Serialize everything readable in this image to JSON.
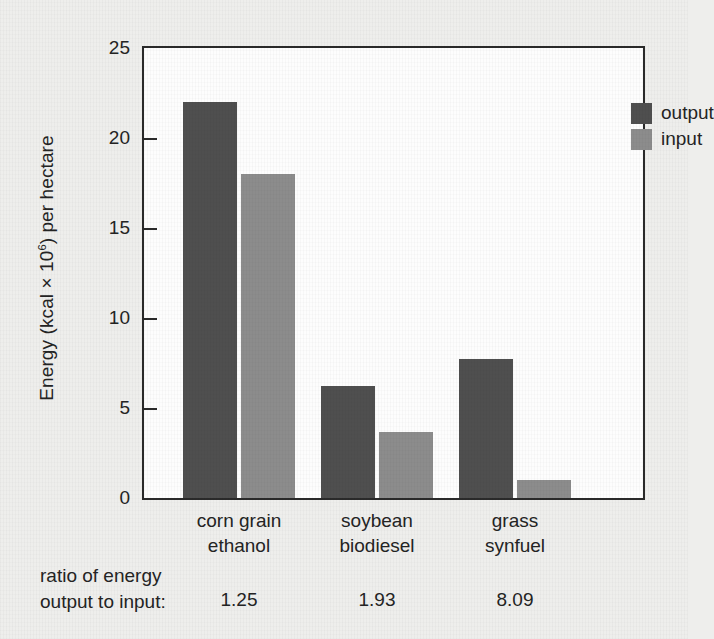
{
  "chart_data": {
    "type": "bar",
    "title": "",
    "subtitle": "",
    "xlabel": "",
    "ylabel": "Energy (kcal × 10⁶) per hectare",
    "ylabel_parts": {
      "before": "Energy (kcal × 10",
      "exponent": "6",
      "after": ") per hectare"
    },
    "categories": [
      "corn grain ethanol",
      "soybean biodiesel",
      "grass synfuel"
    ],
    "category_lines": [
      [
        "corn grain",
        "ethanol"
      ],
      [
        "soybean",
        "biodiesel"
      ],
      [
        "grass",
        "synfuel"
      ]
    ],
    "series": [
      {
        "name": "output",
        "values": [
          22.0,
          6.2,
          7.7
        ],
        "color": "#4f4f4f"
      },
      {
        "name": "input",
        "values": [
          18.0,
          3.65,
          1.0
        ],
        "color": "#8c8c8c"
      }
    ],
    "ylim": [
      0,
      25
    ],
    "yticks": [
      0,
      5,
      10,
      15,
      20,
      25
    ],
    "ytick_labels": [
      "0",
      "5",
      "10",
      "15",
      "20",
      "25"
    ],
    "grid": false,
    "legend_position": "top-right",
    "legend_entries": [
      "output",
      "input"
    ],
    "annotations": {
      "ratio_label_line1": "ratio of energy",
      "ratio_label_line2": "output to input:",
      "ratio_values": [
        "1.25",
        "1.93",
        "8.09"
      ]
    },
    "colors": {
      "output": "#4f4f4f",
      "input": "#8c8c8c",
      "axis": "#2a2a2a",
      "plot_background": "#fdfdfd",
      "page_background": "#eeeeec",
      "text": "#242424"
    }
  }
}
